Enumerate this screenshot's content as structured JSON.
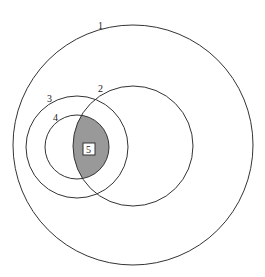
{
  "diagram": {
    "type": "nested-circles",
    "colors": {
      "stroke": "#333333",
      "shaded": "#999999",
      "background": "#ffffff"
    },
    "circles": [
      {
        "id": "1",
        "label": "1",
        "cx": 133,
        "cy": 145,
        "r": 120
      },
      {
        "id": "2",
        "label": "2",
        "cx": 133,
        "cy": 146,
        "r": 60
      },
      {
        "id": "3",
        "label": "3",
        "cx": 77,
        "cy": 147,
        "r": 51
      },
      {
        "id": "4",
        "label": "4",
        "cx": 77,
        "cy": 147,
        "r": 32
      }
    ],
    "region": {
      "label": "5",
      "description": "intersection of circle 2 and circle 4 (shaded)"
    }
  }
}
